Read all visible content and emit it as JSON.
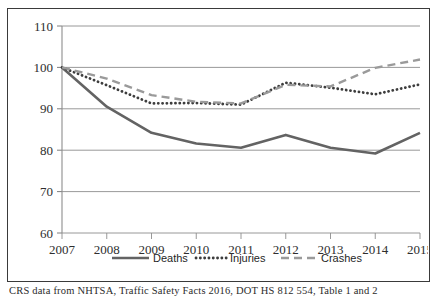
{
  "figure": {
    "caption": "CRS data from NHTSA, Traffic Safety Facts 2016, DOT HS 812 554, Table 1 and 2"
  },
  "chart_data": {
    "type": "line",
    "title": "",
    "subtitle": "",
    "xlabel": "",
    "ylabel": "",
    "x": [
      2007,
      2008,
      2009,
      2010,
      2011,
      2012,
      2013,
      2014,
      2015
    ],
    "categories": [
      "2007",
      "2008",
      "2009",
      "2010",
      "2011",
      "2012",
      "2013",
      "2014",
      "2015"
    ],
    "xtick_labels": [
      "2007",
      "2008",
      "2009",
      "2010",
      "2011",
      "2012",
      "2013",
      "2014",
      "2015"
    ],
    "ytick_labels": [
      "60",
      "70",
      "80",
      "90",
      "100",
      "110"
    ],
    "yticks": [
      60,
      70,
      80,
      90,
      100,
      110
    ],
    "ylim": [
      60,
      110
    ],
    "xlim": [
      2007,
      2015
    ],
    "grid": "horizontal",
    "legend_position": "bottom",
    "series": [
      {
        "name": "Deaths",
        "style": "solid",
        "color": "#636363",
        "values": [
          100.0,
          90.5,
          84.2,
          81.6,
          80.6,
          83.7,
          80.6,
          79.2,
          84.2
        ]
      },
      {
        "name": "Injuries",
        "style": "dotted",
        "color": "#3d3d3d",
        "values": [
          100.0,
          95.7,
          91.3,
          91.4,
          91.0,
          96.3,
          95.1,
          93.5,
          95.9
        ]
      },
      {
        "name": "Crashes",
        "style": "dashed",
        "color": "#9a9a9a",
        "values": [
          100.0,
          97.3,
          93.3,
          91.7,
          91.3,
          95.8,
          95.4,
          99.9,
          101.9
        ]
      }
    ]
  },
  "legend": {
    "items": [
      {
        "label": "Deaths",
        "style": "solid"
      },
      {
        "label": "Injuries",
        "style": "dotted"
      },
      {
        "label": "Crashes",
        "style": "dashed"
      }
    ]
  }
}
